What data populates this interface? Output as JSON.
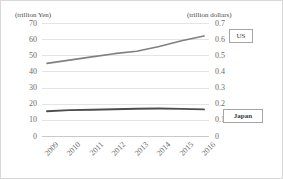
{
  "chart_data": {
    "type": "line",
    "title": "",
    "xlabel": "",
    "categories": [
      "2009",
      "2010",
      "2011",
      "2012",
      "2013",
      "2014",
      "2015",
      "2016"
    ],
    "grid": true,
    "legend_position": "right",
    "axes": {
      "left": {
        "caption": "(trillion Yen)",
        "ticks": [
          "70",
          "60",
          "50",
          "40",
          "30",
          "20",
          "10",
          "0"
        ],
        "values": [
          70,
          60,
          50,
          40,
          30,
          20,
          10,
          0
        ],
        "min": 0,
        "max": 70
      },
      "right": {
        "caption": "(trillion  dollars)",
        "ticks": [
          "0.7",
          "0.6",
          "0.5",
          "0.4",
          "0.3",
          "0.2",
          "0.1",
          "0"
        ],
        "values": [
          0.7,
          0.6,
          0.5,
          0.4,
          0.3,
          0.2,
          0.1,
          0
        ],
        "min": 0,
        "max": 0.7
      }
    },
    "series": [
      {
        "name": "US",
        "axis": "right",
        "unit": "trillion dollars",
        "color": "#808080",
        "values": [
          0.45,
          0.47,
          0.49,
          0.51,
          0.525,
          0.555,
          0.59,
          0.62
        ]
      },
      {
        "name": "Japan",
        "axis": "left",
        "unit": "trillion Yen",
        "color": "#4d4d4d",
        "values": [
          15.3,
          16.0,
          16.3,
          16.6,
          16.9,
          17.0,
          16.8,
          16.5
        ]
      }
    ]
  },
  "legend": {
    "us_label": "US",
    "japan_label": "Japan"
  }
}
